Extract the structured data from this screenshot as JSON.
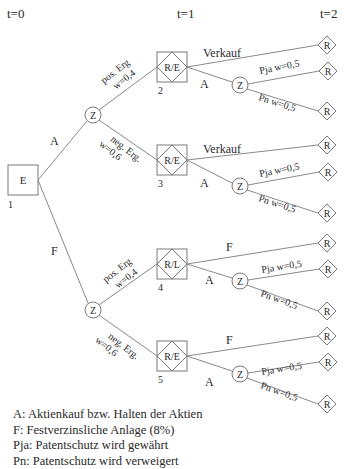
{
  "diagram": {
    "type": "decision-tree",
    "time_labels": [
      "t=0",
      "t=1",
      "t=2"
    ],
    "root": {
      "id": "1",
      "symbol": "E",
      "kind": "decision"
    },
    "first_edges": {
      "A": "A",
      "F": "F"
    },
    "chance_label": "Z",
    "branches": [
      {
        "node_id": "2",
        "node_label": "R/E",
        "incoming_label": "pos. Erg",
        "incoming_prob": "w=0,4",
        "parent": "A",
        "top_label": "Verkauf",
        "mid_label": "A",
        "p_ja": "Pja  w=0,5",
        "p_n": "Pn  w=0,5"
      },
      {
        "node_id": "3",
        "node_label": "R/E",
        "incoming_label": "neg. Erg.",
        "incoming_prob": "w=0,6",
        "parent": "A",
        "top_label": "Verkauf",
        "mid_label": "A",
        "p_ja": "Pja  w=0,5",
        "p_n": "Pn  w=0,5"
      },
      {
        "node_id": "4",
        "node_label": "R/L",
        "incoming_label": "pos. Erg",
        "incoming_prob": "w=0,4",
        "parent": "F",
        "top_label": "F",
        "mid_label": "A",
        "p_ja": "Pja  w=0,5",
        "p_n": "Pn  w=0,5"
      },
      {
        "node_id": "5",
        "node_label": "R/E",
        "incoming_label": "neg. Erg.",
        "incoming_prob": "w=0,6",
        "parent": "F",
        "top_label": "F",
        "mid_label": "A",
        "p_ja": "Pja  w=0,5",
        "p_n": "Pn  w=0,5"
      }
    ],
    "terminal_label": "R"
  },
  "legend": [
    "A: Aktienkauf bzw. Halten der Aktien",
    "F: Festverzinsliche Anlage (8%)",
    "Pja: Patentschutz wird gewährt",
    "Pn: Patentschutz wird verweigert"
  ]
}
